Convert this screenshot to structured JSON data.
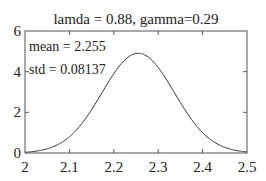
{
  "chart_data": {
    "type": "line",
    "title": "lamda = 0.88, gamma=0.29",
    "xlabel": "",
    "ylabel": "",
    "xlim": [
      2.0,
      2.5
    ],
    "ylim": [
      0,
      6
    ],
    "x_ticks": [
      2,
      2.1,
      2.2,
      2.3,
      2.4,
      2.5
    ],
    "x_tick_labels": [
      "2",
      "2.1",
      "2.2",
      "2.3",
      "2.4",
      "2.5"
    ],
    "y_ticks": [
      0,
      2,
      4,
      6
    ],
    "y_tick_labels": [
      "0",
      "2",
      "4",
      "6"
    ],
    "grid": false,
    "legend": null,
    "annotations": [
      "mean = 2.255",
      "std = 0.08137"
    ],
    "series": [
      {
        "name": "normal pdf",
        "distribution": "normal",
        "mean": 2.255,
        "std": 0.08137,
        "x": [
          2.0,
          2.025,
          2.05,
          2.075,
          2.1,
          2.125,
          2.15,
          2.175,
          2.2,
          2.225,
          2.255,
          2.275,
          2.3,
          2.325,
          2.35,
          2.375,
          2.4,
          2.425,
          2.45,
          2.475,
          2.5
        ],
        "values": [
          0.04,
          0.1,
          0.2,
          0.42,
          0.8,
          1.38,
          2.15,
          3.04,
          3.89,
          4.57,
          4.9,
          4.76,
          4.21,
          3.38,
          2.48,
          1.66,
          1.0,
          0.55,
          0.28,
          0.12,
          0.05
        ]
      }
    ],
    "color": "#333333"
  }
}
